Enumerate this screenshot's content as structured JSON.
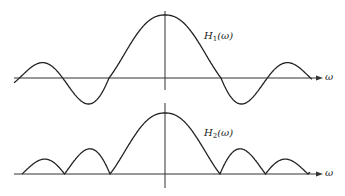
{
  "chart_data": [
    {
      "type": "line",
      "title": "",
      "curve_label": "H1(ω)",
      "label_main": "H",
      "label_sub": "1",
      "label_arg": "(ω)",
      "xlabel": "ω",
      "ylabel": "",
      "description": "sinc-like frequency response with main lobe and oscillating, sign-alternating sidelobes",
      "peak": 1.0,
      "sidelobes_signed": true
    },
    {
      "type": "line",
      "title": "",
      "curve_label": "H2(ω)",
      "label_main": "H",
      "label_sub": "2",
      "label_arg": "(ω)",
      "xlabel": "ω",
      "ylabel": "",
      "description": "magnitude response |sinc| with main lobe and non-negative decreasing arch sidelobes",
      "peak": 1.0,
      "sidelobes_signed": false
    }
  ]
}
